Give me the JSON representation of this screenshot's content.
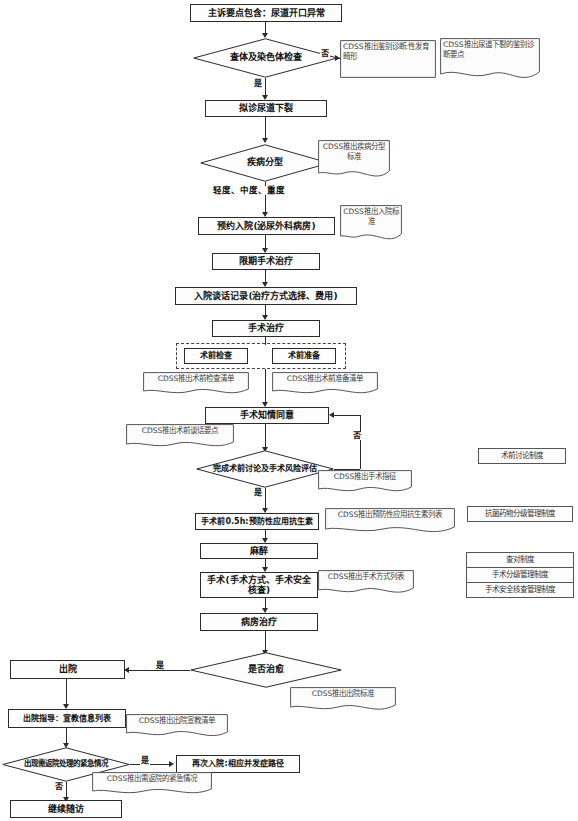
{
  "diagram": {
    "type": "clinical-pathway-flowchart"
  },
  "nodes": {
    "chief_complaint": "主诉要点包含：尿道开口异常",
    "exam_decision": "查体及染色体检查",
    "presumptive_dx": "拟诊尿道下裂",
    "disease_typing": "疾病分型",
    "severity_label": "轻度、中度、重度",
    "admission_booking": "预约入院(泌尿外科病房)",
    "timed_surgery": "限期手术治疗",
    "admission_talk": "入院谈话记录(治疗方式选择、费用)",
    "surgical_treatment": "手术治疗",
    "preop_exam": "术前检查",
    "preop_prep": "术前准备",
    "informed_consent": "手术知情同意",
    "preop_discussion": "完成术前讨论及手术风险评估",
    "antibiotic_prophylaxis": "手术前0.5h:预防性应用抗生素",
    "anesthesia": "麻醉",
    "surgery": "手术(手术方式、手术安全核查)",
    "ward_treatment": "病房治疗",
    "cured_decision": "是否治愈",
    "discharge": "出院",
    "discharge_guidance": "出院指导：宣教信息列表",
    "emergency_decision": "出现需返院处理的紧急情况",
    "readmission": "再次入院:相应并发症路径",
    "continue_followup": "继续随访"
  },
  "edge_labels": {
    "exam_no": "否",
    "exam_yes": "是",
    "consent_no": "否",
    "discussion_yes": "是",
    "cured_yes": "是",
    "emergency_yes": "是",
    "emergency_no": "否"
  },
  "cdss_notes": {
    "differential_dx": "CDSS推出鉴别诊断:性发育畸形",
    "hypospadias_dx_points": "CDSS推出尿道下裂的鉴别诊断要点",
    "typing_standard": "CDSS推出疾病分型标准",
    "admission_standard": "CDSS推出入院标准",
    "preop_exam_list": "CDSS推出术前检查清单",
    "preop_prep_list": "CDSS推出术前准备清单",
    "preop_talk_points": "CDSS推出术前谈话要点",
    "surgical_indication": "CDSS推出手术指征",
    "antibiotic_list": "CDSS推出预防性应用抗生素列表",
    "surgery_method_list": "CDSS推出手术方式列表",
    "discharge_standard": "CDSS推出出院标准",
    "discharge_education_list": "CDSS推出出院宣教清单",
    "emergency_list": "CDSS推出需返院的紧急情况"
  },
  "regulations": {
    "preop_discussion_system": "术前讨论制度",
    "antibiotic_grading_system": "抗菌药物分级管理制度",
    "checklist": [
      "查对制度",
      "手术分级管理制度",
      "手术安全核查管理制度"
    ]
  },
  "colors": {
    "stroke": "#2b2b2b",
    "note_stroke": "#555555",
    "text": "#111111",
    "note_text": "#3d3d3d",
    "background": "#ffffff"
  }
}
